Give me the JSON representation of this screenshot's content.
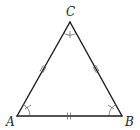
{
  "diagram": {
    "type": "equilateral-triangle",
    "vertices": [
      {
        "id": "A",
        "label": "A"
      },
      {
        "id": "B",
        "label": "B"
      },
      {
        "id": "C",
        "label": "C"
      }
    ],
    "sides": [
      {
        "from": "A",
        "to": "B",
        "marks": "double-tick"
      },
      {
        "from": "B",
        "to": "C",
        "marks": "double-tick"
      },
      {
        "from": "C",
        "to": "A",
        "marks": "double-tick"
      }
    ],
    "angles": [
      {
        "vertex": "A",
        "marks": "arc-with-tick"
      },
      {
        "vertex": "B",
        "marks": "arc-with-tick"
      },
      {
        "vertex": "C",
        "marks": "arc-with-tick"
      }
    ],
    "colors": {
      "edge": "#1a1a1a",
      "mark": "#555555",
      "label": "#222222"
    }
  }
}
